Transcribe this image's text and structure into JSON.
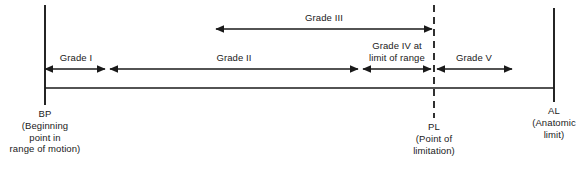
{
  "figure": {
    "type": "range-of-motion-grade-diagram",
    "background_color": "#ffffff",
    "line_color": "#1a1a1a",
    "text_color": "#1a1a1a"
  },
  "axis": {
    "baseline_y": 88,
    "start_x": 45,
    "end_x": 554
  },
  "markers": [
    {
      "id": "bp",
      "abbr": "BP",
      "x": 45,
      "style": "solid",
      "top_y": 5,
      "bottom_y": 105,
      "caption_lines": [
        "BP",
        "(Beginning",
        "point in",
        "range of motion)"
      ]
    },
    {
      "id": "pl",
      "abbr": "PL",
      "x": 434,
      "style": "dashed",
      "top_y": 5,
      "bottom_y": 118,
      "caption_lines": [
        "PL",
        "(Point of",
        "limitation)"
      ]
    },
    {
      "id": "al",
      "abbr": "AL",
      "x": 554,
      "style": "solid",
      "top_y": 8,
      "bottom_y": 102,
      "caption_lines": [
        "AL",
        "(Anatomic",
        "limit)"
      ]
    }
  ],
  "grades": [
    {
      "id": "grade-1",
      "label_lines": [
        "Grade I"
      ],
      "label_x": 76,
      "label_y": 52,
      "arrow_y": 69,
      "x1": 45,
      "x2": 105,
      "arrow_start": true,
      "arrow_end": true
    },
    {
      "id": "grade-2",
      "label_lines": [
        "Grade II"
      ],
      "label_x": 234,
      "label_y": 52,
      "arrow_y": 69,
      "x1": 110,
      "x2": 358,
      "arrow_start": true,
      "arrow_end": true
    },
    {
      "id": "grade-3",
      "label_lines": [
        "Grade III"
      ],
      "label_x": 324,
      "label_y": 12,
      "arrow_y": 29,
      "x1": 216,
      "x2": 432,
      "arrow_start": true,
      "arrow_end": true
    },
    {
      "id": "grade-4",
      "label_lines": [
        "Grade IV at",
        "limit of range"
      ],
      "label_x": 397,
      "label_y": 40,
      "arrow_y": 69,
      "x1": 363,
      "x2": 431,
      "arrow_start": true,
      "arrow_end": true
    },
    {
      "id": "grade-5",
      "label_lines": [
        "Grade V"
      ],
      "label_x": 474,
      "label_y": 52,
      "arrow_y": 69,
      "x1": 437,
      "x2": 512,
      "arrow_start": true,
      "arrow_end": true
    }
  ]
}
